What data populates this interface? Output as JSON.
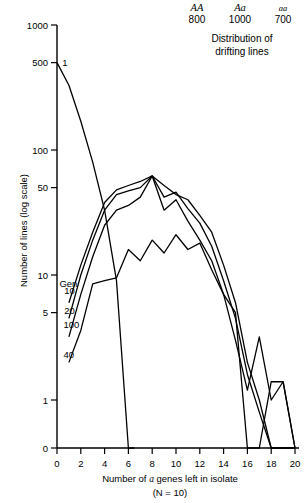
{
  "legend": {
    "genotypes": [
      "AA",
      "Aa",
      "aa"
    ],
    "counts": [
      "800",
      "1000",
      "700"
    ]
  },
  "title": {
    "line1": "Distribution of",
    "line2": "drifting lines"
  },
  "axes": {
    "ylabel": "Number of lines (log scale)",
    "xlabel_pre": "Number of ",
    "xlabel_ital": "a",
    "xlabel_post": " genes left in isolate",
    "xlabel_line2": "(N = 10)"
  },
  "chart_data": {
    "type": "line",
    "title": "Distribution of drifting lines",
    "xlabel": "Number of a genes left in isolate (N = 10)",
    "ylabel": "Number of lines (log scale)",
    "yscale": "log-with-zero",
    "ylim": [
      0,
      1000
    ],
    "xlim": [
      0,
      20
    ],
    "ytick_labels": [
      "1000",
      "500",
      "100",
      "50",
      "10",
      "5",
      "1",
      "0"
    ],
    "ytick_values": [
      1000,
      500,
      100,
      50,
      10,
      5,
      1,
      0
    ],
    "xtick_labels": [
      "0",
      "2",
      "4",
      "6",
      "8",
      "10",
      "12",
      "14",
      "16",
      "18",
      "20"
    ],
    "xtick_values": [
      0,
      2,
      4,
      6,
      8,
      10,
      12,
      14,
      16,
      18,
      20
    ],
    "grid": false,
    "legend_position": "inline-curve-labels",
    "series": [
      {
        "name": "Gen 1",
        "label": "1",
        "label_x": 0.45,
        "label_y": 500,
        "x": [
          0,
          1,
          2,
          3,
          4,
          5,
          6,
          6.5
        ],
        "y": [
          500,
          330,
          170,
          80,
          33,
          9,
          0,
          0
        ]
      },
      {
        "name": "Gen 10",
        "label": "10",
        "label_x": 0.6,
        "label_y": 7.5,
        "x": [
          1,
          2,
          3,
          4,
          5,
          6,
          7,
          8,
          9,
          10,
          11,
          12,
          13,
          14,
          15,
          16,
          17,
          18,
          19,
          20
        ],
        "y": [
          6,
          12,
          22,
          38,
          48,
          52,
          56,
          62,
          52,
          44,
          40,
          30,
          22,
          12,
          6,
          2,
          1,
          0,
          0,
          0
        ]
      },
      {
        "name": "Gen 20",
        "label": "20",
        "label_x": 0.6,
        "label_y": 5.2,
        "x": [
          1,
          2,
          3,
          4,
          5,
          6,
          7,
          8,
          9,
          10,
          11,
          12,
          13,
          14,
          15,
          16,
          17,
          18,
          19,
          20
        ],
        "y": [
          4.5,
          10,
          19,
          33,
          44,
          47,
          50,
          62,
          42,
          46,
          34,
          26,
          17,
          9,
          4.5,
          1.6,
          0.8,
          0,
          0,
          0
        ]
      },
      {
        "name": "Gen 100",
        "label": "100",
        "label_x": 0.55,
        "label_y": 4.0,
        "x": [
          1,
          2,
          3,
          4,
          5,
          6,
          7,
          8,
          9,
          10,
          11,
          12,
          13,
          14,
          15,
          16,
          17,
          18,
          19,
          20
        ],
        "y": [
          3.2,
          7,
          14,
          25,
          33,
          36,
          42,
          62,
          33,
          40,
          27,
          19,
          13,
          7,
          3,
          1.2,
          3.2,
          1,
          1.4,
          0
        ]
      },
      {
        "name": "Gen 40",
        "label": "40",
        "label_x": 0.55,
        "label_y": 2.3,
        "x": [
          1,
          2,
          3,
          4,
          5,
          6,
          7,
          8,
          9,
          10,
          11,
          12,
          13,
          14,
          15,
          16,
          17,
          18,
          19,
          20
        ],
        "y": [
          2.0,
          3.6,
          8.5,
          9.0,
          9.5,
          16,
          13,
          19,
          15,
          21,
          16,
          18,
          11,
          7,
          5,
          0,
          0,
          1.4,
          1.4,
          0
        ]
      },
      {
        "name": "Gen label",
        "label": "Gen",
        "label_x": 0.2,
        "label_y": 8.6,
        "x": [],
        "y": []
      }
    ]
  }
}
